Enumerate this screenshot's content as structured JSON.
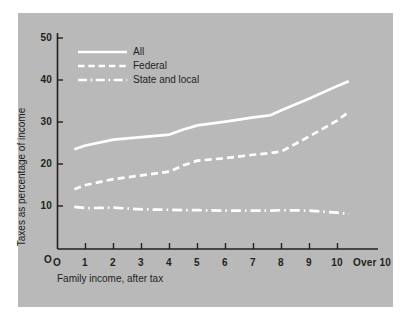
{
  "chart_data": {
    "type": "line",
    "title": "",
    "subtitle": "",
    "xlabel": "Family income, after tax",
    "ylabel": "Taxes as percentage of income",
    "grid": false,
    "legend_position": "top-left inside plot",
    "xlim": [
      0,
      11
    ],
    "ylim": [
      0,
      50
    ],
    "xticklabels": [
      "O",
      "1",
      "2",
      "3",
      "4",
      "5",
      "6",
      "7",
      "8",
      "9",
      "10",
      "Over 10"
    ],
    "xtickvalues": [
      0,
      1,
      2,
      3,
      4,
      5,
      6,
      7,
      8,
      9,
      10,
      11
    ],
    "yticklabels": [
      "O",
      "10",
      "20",
      "30",
      "40",
      "50"
    ],
    "ytickvalues": [
      0,
      10,
      20,
      30,
      40,
      50
    ],
    "x": [
      0.6,
      1,
      2,
      3,
      4,
      4.5,
      5,
      6,
      7,
      7.6,
      8,
      9,
      10,
      10.4
    ],
    "series": [
      {
        "name": "All",
        "style": "solid",
        "color": "#ffffff",
        "values": [
          23.5,
          24.4,
          25.8,
          26.4,
          27.0,
          28.2,
          29.2,
          30.1,
          31.1,
          31.6,
          32.8,
          35.6,
          38.6,
          39.7
        ]
      },
      {
        "name": "Federal",
        "style": "dashed",
        "color": "#ffffff",
        "values": [
          14.0,
          15.0,
          16.4,
          17.3,
          18.2,
          19.7,
          20.8,
          21.4,
          22.2,
          22.6,
          23.0,
          26.6,
          30.4,
          32.4
        ]
      },
      {
        "name": "State and local",
        "style": "dash-dot",
        "color": "#ffffff",
        "values": [
          9.8,
          9.5,
          9.6,
          9.2,
          9.1,
          9.0,
          9.0,
          8.9,
          8.9,
          8.9,
          9.0,
          8.9,
          8.4,
          8.1
        ]
      }
    ]
  },
  "legend": {
    "items": [
      {
        "label": "All",
        "style": "solid"
      },
      {
        "label": "Federal",
        "style": "dashed"
      },
      {
        "label": "State and local",
        "style": "dash-dot"
      }
    ]
  },
  "axes": {
    "y": {
      "label": "Taxes as percentage of income",
      "ticks": [
        {
          "label": "50"
        },
        {
          "label": "40"
        },
        {
          "label": "30"
        },
        {
          "label": "20"
        },
        {
          "label": "10"
        },
        {
          "label": "O"
        }
      ]
    },
    "x": {
      "label": "Family income, after tax",
      "ticks": [
        {
          "label": "O"
        },
        {
          "label": "1"
        },
        {
          "label": "2"
        },
        {
          "label": "3"
        },
        {
          "label": "4"
        },
        {
          "label": "5"
        },
        {
          "label": "6"
        },
        {
          "label": "7"
        },
        {
          "label": "8"
        },
        {
          "label": "9"
        },
        {
          "label": "10"
        },
        {
          "label": "Over 10"
        }
      ]
    }
  },
  "colors": {
    "panel_background": "#b9b9b9",
    "figure_background": "#ffffff",
    "axis": "#231f20",
    "series": "#ffffff"
  }
}
